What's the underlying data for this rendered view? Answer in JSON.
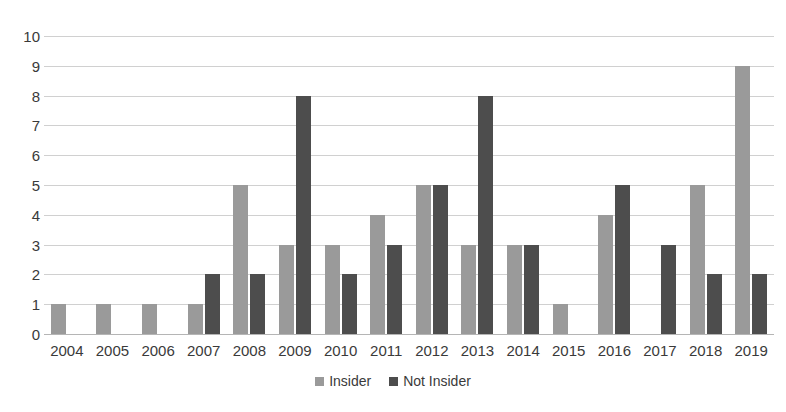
{
  "chart_data": {
    "type": "bar",
    "title": "",
    "subtitle": "",
    "xlabel": "",
    "ylabel": "",
    "ylim": [
      0,
      10
    ],
    "ytick_step": 1,
    "yticks": [
      10,
      9,
      8,
      7,
      6,
      5,
      4,
      3,
      2,
      1,
      0
    ],
    "grid": true,
    "legend_position": "bottom",
    "categories": [
      "2004",
      "2005",
      "2006",
      "2007",
      "2008",
      "2009",
      "2010",
      "2011",
      "2012",
      "2013",
      "2014",
      "2015",
      "2016",
      "2017",
      "2018",
      "2019"
    ],
    "series": [
      {
        "name": "Insider",
        "color": "#9a9a9a",
        "values": [
          1,
          1,
          1,
          1,
          5,
          3,
          3,
          4,
          5,
          3,
          3,
          1,
          4,
          0,
          5,
          9
        ]
      },
      {
        "name": "Not Insider",
        "color": "#4d4d4d",
        "values": [
          0,
          0,
          0,
          2,
          2,
          8,
          2,
          3,
          5,
          8,
          3,
          0,
          5,
          3,
          2,
          2
        ]
      }
    ]
  },
  "legend": {
    "items": [
      {
        "label": "Insider"
      },
      {
        "label": "Not Insider"
      }
    ]
  },
  "colors": {
    "insider": "#9a9a9a",
    "not_insider": "#4d4d4d",
    "gridline": "#d0d0d0",
    "axis": "#b5b5b5",
    "text": "#3a3a3a",
    "background": "#ffffff"
  }
}
